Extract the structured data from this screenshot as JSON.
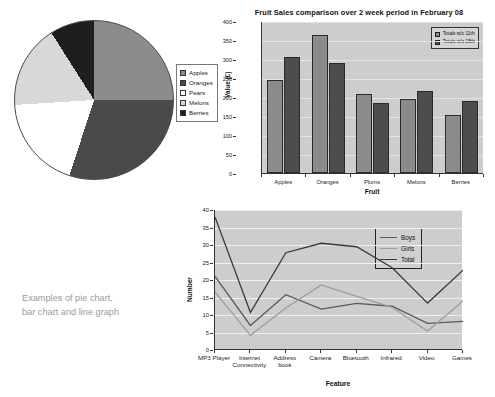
{
  "caption": {
    "line1": "Examples of pie chart,",
    "line2": "bar chart and line graph"
  },
  "colors": {
    "plot_background": "#cdcdcd",
    "bar_series_1": "#8b8b8b",
    "bar_series_2": "#4d4d4d",
    "line_boys": "#5a5a5a",
    "line_girls": "#9d9d9d",
    "line_total": "#3a3a3a",
    "pie_apples": "#8c8c8c",
    "pie_oranges": "#4a4a4a",
    "pie_pears": "#ffffff",
    "pie_melons": "#d8d8d8",
    "pie_berries": "#1e1e1e"
  },
  "chart_data": [
    {
      "type": "pie",
      "title": "",
      "legend_position": "right",
      "categories": [
        "Apples",
        "Oranges",
        "Pears",
        "Melons",
        "Berries"
      ],
      "values": [
        25,
        30,
        19,
        17,
        9
      ],
      "slice_colors": [
        "#8c8c8c",
        "#4a4a4a",
        "#ffffff",
        "#d8d8d8",
        "#1e1e1e"
      ],
      "start_angle_deg": 0,
      "direction": "clockwise"
    },
    {
      "type": "bar",
      "title": "Fruit Sales comparison over 2 week period in February 08",
      "xlabel": "Fruit",
      "ylabel": "Value (£)",
      "ylim": [
        0,
        400
      ],
      "yticks": [
        0,
        50,
        100,
        150,
        200,
        250,
        300,
        350,
        400
      ],
      "grid": true,
      "legend_position": "top-right",
      "categories": [
        "Apples",
        "Oranges",
        "Plums",
        "Melons",
        "Berries"
      ],
      "series": [
        {
          "name": "Totals w/c 11th",
          "values": [
            245,
            362,
            208,
            195,
            152
          ],
          "color": "#8b8b8b"
        },
        {
          "name": "Totals w/c 18th",
          "values": [
            305,
            290,
            185,
            215,
            190
          ],
          "color": "#4d4d4d"
        }
      ]
    },
    {
      "type": "line",
      "title": "",
      "xlabel": "Feature",
      "ylabel": "Number",
      "ylim": [
        0,
        40
      ],
      "yticks": [
        0,
        5,
        10,
        15,
        20,
        25,
        30,
        35,
        40
      ],
      "grid": true,
      "legend_position": "top-right-inside",
      "categories": [
        "MP3 Player",
        "Internet Connectivity",
        "Address book",
        "Camera",
        "Bluetooth",
        "Infrared",
        "Video",
        "Games"
      ],
      "series": [
        {
          "name": "Boys",
          "values": [
            21.0,
            7.0,
            15.8,
            11.7,
            13.3,
            12.5,
            7.6,
            8.2
          ],
          "color": "#5a5a5a"
        },
        {
          "name": "Girls",
          "values": [
            16.6,
            4.2,
            12.0,
            18.6,
            15.3,
            12.2,
            5.4,
            14.0
          ],
          "color": "#9d9d9d"
        },
        {
          "name": "Total",
          "values": [
            38.0,
            10.7,
            27.8,
            30.5,
            29.5,
            23.5,
            13.4,
            22.8
          ],
          "color": "#3a3a3a"
        }
      ]
    }
  ]
}
